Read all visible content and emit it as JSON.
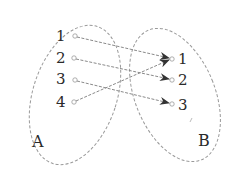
{
  "diagram": {
    "type": "mapping",
    "set_a": {
      "label": "A",
      "elements": [
        "1",
        "2",
        "3",
        "4"
      ]
    },
    "set_b": {
      "label": "B",
      "elements": [
        "1",
        "2",
        "3"
      ]
    },
    "mappings": [
      {
        "from": "1",
        "to": "1"
      },
      {
        "from": "2",
        "to": "2"
      },
      {
        "from": "3",
        "to": "3"
      },
      {
        "from": "4",
        "to": "1"
      }
    ],
    "colors": {
      "line": "#8a8a8a",
      "arrow": "#333333",
      "text": "#2a2a2a"
    }
  }
}
